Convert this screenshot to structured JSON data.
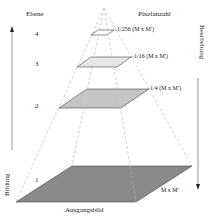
{
  "diagram": {
    "title_left": "Ebene",
    "title_right": "Pixelanzahl",
    "left_axis_label": "Bildung",
    "right_axis_label": "Bearbeitung",
    "base_label": "Ausgangsbild",
    "levels": [
      {
        "number": "4",
        "pixel_label": "1/256 (M x M')",
        "fill": "#ffffff"
      },
      {
        "number": "3",
        "pixel_label": "1/16 (M x M')",
        "fill": "#e6e6e6"
      },
      {
        "number": "2",
        "pixel_label": "1/4 (M x M')",
        "fill": "#c4c4c4"
      },
      {
        "number": "1",
        "pixel_label": "M x M'",
        "fill": "#8a8a8a"
      }
    ],
    "colors": {
      "line": "#444444",
      "dashed": "#bdbdbd",
      "text": "#222222"
    }
  }
}
